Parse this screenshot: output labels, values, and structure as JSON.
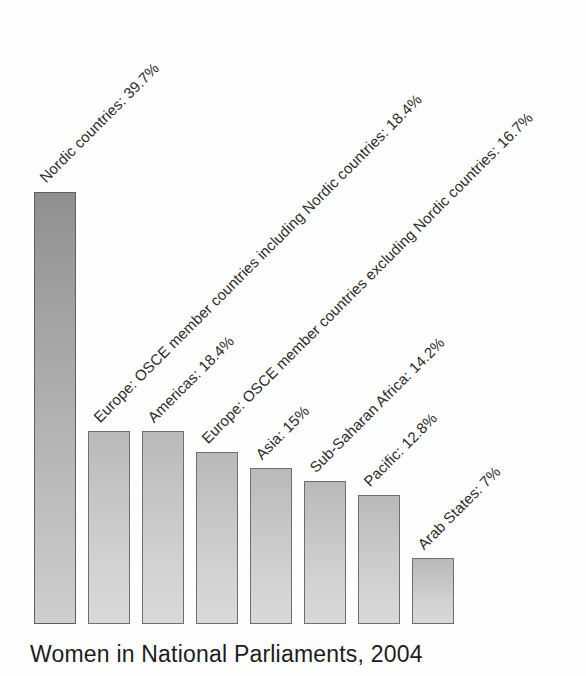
{
  "chart_data": {
    "type": "bar",
    "title": "Women in National Parliaments, 2004",
    "xlabel": "",
    "ylabel": "",
    "ylim": [
      0,
      44
    ],
    "grid": false,
    "legend": "none",
    "value_suffix": "%",
    "categories": [
      "Nordic countries",
      "Europe: OSCE member countries including Nordic countries",
      "Americas",
      "Europe: OSCE member countries excluding Nordic countries",
      "Asia",
      "Sub-Saharan Africa",
      "Pacific",
      "Arab States"
    ],
    "values": [
      39.7,
      18.4,
      18.4,
      16.7,
      15,
      14.2,
      12.8,
      7
    ],
    "point_labels": [
      "Nordic countries: 39.7%",
      "Europe: OSCE member countries including Nordic countries: 18.4%",
      "Americas: 18.4%",
      "Europe: OSCE member countries excluding Nordic countries: 16.7%",
      "Asia: 15%",
      "Sub-Saharan Africa: 14.2%",
      "Pacific: 12.8%",
      "Arab States: 7%"
    ],
    "label_rotation_deg": -45,
    "bar_color": "#c9c9c9",
    "bar_edge_color": "#6e6e6e",
    "highlight_bar_color": "#a8a8a8",
    "text_color": "#2b2b2b",
    "background_color": "#ffffff"
  },
  "geometry": {
    "baseline_y": 624,
    "bar_width": 42,
    "bar_pitch": 54,
    "first_bar_x": 34,
    "bars": [
      {
        "x": 34,
        "top": 192,
        "height": 432,
        "tall": true
      },
      {
        "x": 88,
        "top": 431,
        "height": 193,
        "tall": false
      },
      {
        "x": 142,
        "top": 431,
        "height": 193,
        "tall": false
      },
      {
        "x": 196,
        "top": 452,
        "height": 172,
        "tall": false
      },
      {
        "x": 250,
        "top": 468,
        "height": 156,
        "tall": false
      },
      {
        "x": 304,
        "top": 481,
        "height": 143,
        "tall": false
      },
      {
        "x": 358,
        "top": 495,
        "height": 129,
        "tall": false
      },
      {
        "x": 412,
        "top": 558,
        "height": 66,
        "tall": false
      }
    ],
    "labels": [
      {
        "x": 42,
        "y": 172,
        "size": 15
      },
      {
        "x": 96,
        "y": 412,
        "size": 15
      },
      {
        "x": 150,
        "y": 412,
        "size": 15
      },
      {
        "x": 204,
        "y": 433,
        "size": 15
      },
      {
        "x": 258,
        "y": 449,
        "size": 15
      },
      {
        "x": 312,
        "y": 462,
        "size": 15
      },
      {
        "x": 366,
        "y": 476,
        "size": 15
      },
      {
        "x": 420,
        "y": 539,
        "size": 15
      }
    ]
  }
}
